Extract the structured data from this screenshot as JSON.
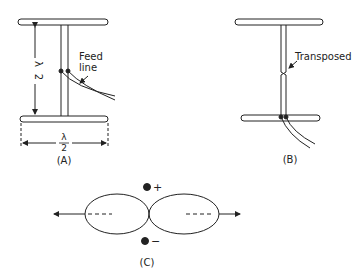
{
  "figure_a": {
    "caption": "(A)",
    "feed_label_line1": "Feed",
    "feed_label_line2": "line",
    "height_dim": {
      "num": "λ",
      "den": "2"
    },
    "width_dim": {
      "num": "λ",
      "den": "2"
    }
  },
  "figure_b": {
    "caption": "(B)",
    "transposed_label": "Transposed"
  },
  "figure_c": {
    "caption": "(C)",
    "plus_label": "+",
    "minus_label": "−"
  },
  "colors": {
    "stroke": "#222222",
    "background": "#ffffff"
  }
}
